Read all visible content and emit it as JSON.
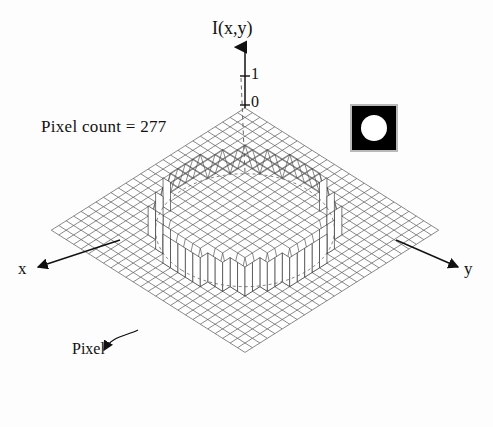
{
  "figure": {
    "axis_vertical_label": "I(x,y)",
    "axis_x_label": "x",
    "axis_y_label": "y",
    "tick_high": "1",
    "tick_zero": "0",
    "annotation_pixel_count": "Pixel count = 277",
    "annotation_pixel": "Pixel",
    "colors": {
      "ink": "#111111",
      "mesh": "#4a4a4a",
      "background": "#fdfdfd",
      "inset_background": "#000000",
      "inset_disk": "#ffffff",
      "inset_border": "#b9b9b9"
    }
  },
  "chart_data": {
    "type": "surface",
    "title": "",
    "xlabel": "x",
    "ylabel": "y",
    "zlabel": "I(x,y)",
    "zticks": [
      0,
      1
    ],
    "zlim": [
      0,
      1
    ],
    "grid_columns": 26,
    "grid_rows": 26,
    "plateau_shape": "circle",
    "plateau_value": 1,
    "base_value": 0,
    "plateau_radius_cells": 8.5,
    "plateau_center_cell": [
      13,
      13
    ],
    "pixel_count": 277,
    "annotations": [
      {
        "text": "Pixel count = 277",
        "kind": "text"
      },
      {
        "text": "Pixel",
        "kind": "callout",
        "points_to": "single mesh cell on lower-left edge"
      },
      {
        "text": "dashed circle",
        "kind": "guide",
        "points_to": "disk boundary projected on base plane"
      }
    ],
    "inset": {
      "type": "binary-image",
      "background": "black",
      "foreground": "white",
      "shape": "disk"
    },
    "grid": true,
    "legend": false
  }
}
